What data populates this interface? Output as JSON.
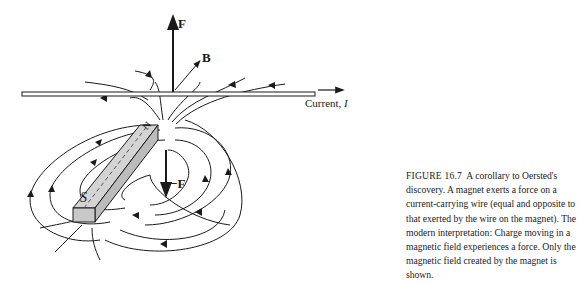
{
  "figure": {
    "labels": {
      "force_up": "F",
      "field": "B",
      "current": "Current, ",
      "current_symbol": "I",
      "force_down": "−F",
      "north": "N",
      "south": "S"
    },
    "caption": {
      "number": "FIGURE 16.7",
      "text": "A corollary to Oersted's discovery. A magnet exerts a force on a current-carrying wire (equal and opposite to that exerted by the wire on the magnet). The modern interpretation: Charge moving in a magnetic field experiences a force. Only the magnetic field created by the magnet is shown."
    }
  }
}
